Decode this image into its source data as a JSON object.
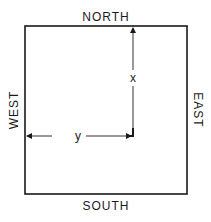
{
  "diagram": {
    "labels": {
      "north": "NORTH",
      "south": "SOUTH",
      "east": "EAST",
      "west": "WEST"
    },
    "variables": {
      "x": "x",
      "y": "y"
    },
    "colors": {
      "line": "#1a1a1a",
      "arrow": "#333333",
      "background": "#ffffff"
    }
  }
}
